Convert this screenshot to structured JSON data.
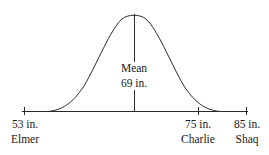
{
  "diagram": {
    "type": "normal-distribution",
    "mean_label": "Mean",
    "mean_value": "69 in.",
    "line_color": "#2a2a2a",
    "markers": [
      {
        "value": "53 in.",
        "name": "Elmer"
      },
      {
        "value": "75 in.",
        "name": "Charlie"
      },
      {
        "value": "85 in.",
        "name": "Shaq"
      }
    ]
  }
}
